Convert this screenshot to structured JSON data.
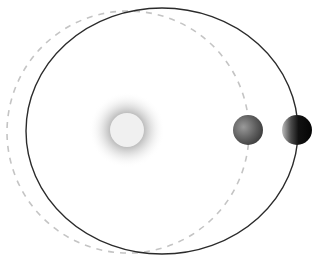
{
  "diagram": {
    "colors": {
      "background": "#ffffff",
      "solid_orbit": "#2b2b2b",
      "dashed_orbit": "#c4c4c4",
      "star_core": "#f0f0f0",
      "star_halo": "#8a8a8a",
      "planet_light": "#6e6e6e",
      "planet_dark": "#0e0e0e"
    },
    "star": {
      "cx": 127,
      "cy": 130,
      "r": 17,
      "halo_r": 38
    },
    "circular_orbit": {
      "cx": 128,
      "cy": 132,
      "r": 121,
      "style": "dashed"
    },
    "elliptical_orbit": {
      "cx": 162,
      "cy": 131,
      "rx": 136,
      "ry": 123,
      "style": "solid"
    },
    "planets": [
      {
        "name": "planet-on-circular-orbit",
        "cx": 248,
        "cy": 130,
        "r": 15
      },
      {
        "name": "planet-on-elliptical-orbit",
        "cx": 297,
        "cy": 130,
        "r": 15
      }
    ]
  }
}
